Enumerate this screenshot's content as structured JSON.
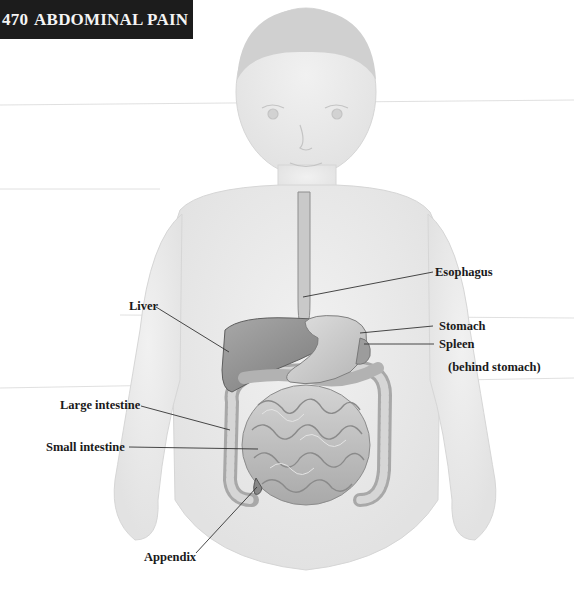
{
  "header": {
    "page_number": "470",
    "title": "ABDOMINAL PAIN"
  },
  "figure": {
    "labels": [
      {
        "id": "esophagus",
        "text": "Esophagus"
      },
      {
        "id": "liver",
        "text": "Liver"
      },
      {
        "id": "stomach",
        "text": "Stomach"
      },
      {
        "id": "spleen",
        "text": "Spleen"
      },
      {
        "id": "spleen_note",
        "text": "(behind stomach)"
      },
      {
        "id": "large_intestine",
        "text": "Large intestine"
      },
      {
        "id": "small_intestine",
        "text": "Small intestine"
      },
      {
        "id": "appendix",
        "text": "Appendix"
      }
    ]
  },
  "colors": {
    "header_bg": "#1c1c1c",
    "header_text": "#f4f4f4",
    "label_text": "#1a1a1a",
    "body_tone": "#eaeaea",
    "organ_dark": "#8a8a8a",
    "organ_light": "#c8c8c8"
  }
}
